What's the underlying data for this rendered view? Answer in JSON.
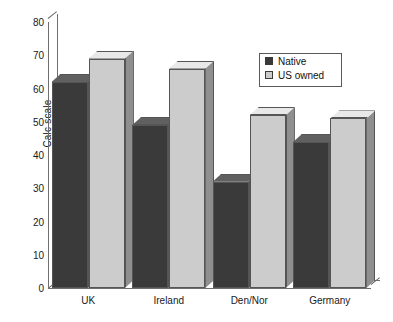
{
  "chart_data": {
    "type": "bar",
    "title": "",
    "subtitle": "",
    "xlabel": "",
    "ylabel": "Calc scale",
    "categories": [
      "UK",
      "Ireland",
      "Den/Nor",
      "Germany"
    ],
    "series": [
      {
        "name": "Native",
        "color": "#3a3a3a",
        "values": [
          62,
          49,
          32,
          44
        ]
      },
      {
        "name": "US owned",
        "color": "#cccccc",
        "values": [
          69,
          66,
          52,
          51
        ]
      }
    ],
    "ylim": [
      0,
      80
    ],
    "yticks": [
      0,
      10,
      20,
      30,
      40,
      50,
      60,
      70,
      80
    ],
    "ytick_labels": [
      "0",
      "10",
      "20",
      "30",
      "40",
      "50",
      "60",
      "70",
      "80"
    ],
    "grid": false,
    "legend_position": "top-right",
    "style": "3d-bars",
    "annotations": []
  },
  "legend": {
    "entries": [
      {
        "label": "Native",
        "color": "#3a3a3a"
      },
      {
        "label": "US owned",
        "color": "#cccccc"
      }
    ]
  },
  "colors": {
    "native_front": "#3a3a3a",
    "native_side": "#2b2b2b",
    "native_top": "#606060",
    "us_front": "#cccccc",
    "us_side": "#8f8f8f",
    "us_top": "#e8e8e8",
    "axis": "#6f6f6f",
    "text": "#1a1a1a",
    "background": "#ffffff"
  }
}
